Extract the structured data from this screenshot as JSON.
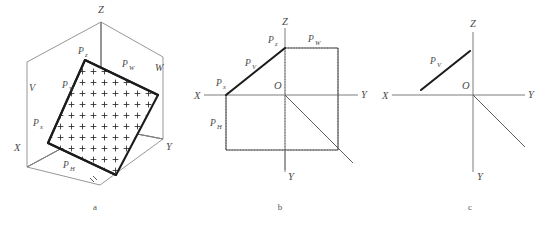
{
  "figure": {
    "colors": {
      "background": "#ffffff",
      "axis": "#7d7d7d",
      "trace": "#1c1c1c",
      "box": "#8a8a8a",
      "text": "#4a4a4a"
    },
    "panels": [
      {
        "id": "a",
        "caption": "a",
        "type": "axonometric-3d",
        "axes": [
          {
            "name": "z-axis",
            "label": "Z",
            "label_x": 101,
            "label_y": 13
          },
          {
            "name": "x-axis",
            "label": "X",
            "label_x": 14,
            "label_y": 151
          },
          {
            "name": "y-axis",
            "label": "Y",
            "label_x": 166,
            "label_y": 150
          }
        ],
        "planes": [
          {
            "name": "v-plane",
            "label": "V",
            "label_x": 29,
            "label_y": 91
          },
          {
            "name": "w-plane",
            "label": "W",
            "label_x": 155,
            "label_y": 71
          }
        ],
        "traces": [
          {
            "name": "pz-point",
            "base": "P",
            "sub": "z",
            "label_x": 78,
            "label_y": 54
          },
          {
            "name": "pv-trace",
            "base": "P",
            "sub": "V",
            "label_x": 62,
            "label_y": 88
          },
          {
            "name": "pw-trace",
            "base": "P",
            "sub": "W",
            "label_x": 122,
            "label_y": 67
          },
          {
            "name": "px-point",
            "base": "P",
            "sub": "x",
            "label_x": 33,
            "label_y": 126
          },
          {
            "name": "ph-trace",
            "base": "P",
            "sub": "H",
            "label_x": 63,
            "label_y": 168
          }
        ]
      },
      {
        "id": "b",
        "caption": "b",
        "type": "unfolded-projection",
        "axes": [
          {
            "name": "z-axis",
            "label": "Z",
            "label_x": 93,
            "label_y": 25
          },
          {
            "name": "x-axis",
            "label": "X",
            "label_x": 4,
            "label_y": 95
          },
          {
            "name": "y-axis-right",
            "label": "Y",
            "label_x": 171,
            "label_y": 94
          },
          {
            "name": "y-axis-bottom",
            "label": "Y",
            "label_x": 96,
            "label_y": 176
          }
        ],
        "origin": {
          "name": "origin-label",
          "label": "O",
          "label_x": 84,
          "label_y": 86
        },
        "traces": [
          {
            "name": "pz-point",
            "base": "P",
            "sub": "z",
            "label_x": 78,
            "label_y": 43
          },
          {
            "name": "pw-trace",
            "base": "P",
            "sub": "W",
            "label_x": 124,
            "label_y": 42
          },
          {
            "name": "pv-trace",
            "base": "P",
            "sub": "V",
            "label_x": 55,
            "label_y": 63
          },
          {
            "name": "px-point",
            "base": "P",
            "sub": "x",
            "label_x": 28,
            "label_y": 85
          },
          {
            "name": "ph-trace",
            "base": "P",
            "sub": "H",
            "label_x": 23,
            "label_y": 126
          }
        ]
      },
      {
        "id": "c",
        "caption": "c",
        "type": "simplified-trace",
        "axes": [
          {
            "name": "z-axis",
            "label": "Z",
            "label_x": 102,
            "label_y": 26
          },
          {
            "name": "x-axis",
            "label": "X",
            "label_x": 14,
            "label_y": 97
          },
          {
            "name": "y-axis-right",
            "label": "Y",
            "label_x": 158,
            "label_y": 95
          },
          {
            "name": "y-axis-bottom",
            "label": "Y",
            "label_x": 110,
            "label_y": 178
          }
        ],
        "origin": {
          "name": "origin-label",
          "label": "O",
          "label_x": 93,
          "label_y": 87
        },
        "traces": [
          {
            "name": "pv-trace",
            "base": "P",
            "sub": "V",
            "label_x": 63,
            "label_y": 62
          }
        ]
      }
    ]
  }
}
